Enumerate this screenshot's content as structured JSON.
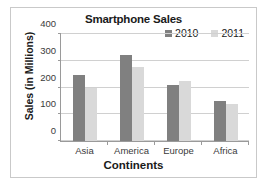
{
  "chart_data": {
    "type": "bar",
    "title": "Smartphone Sales",
    "xlabel": "Continents",
    "ylabel": "Sales (in Millions)",
    "categories": [
      "Asia",
      "America",
      "Europe",
      "Africa"
    ],
    "series": [
      {
        "name": "2010",
        "color": "#808080",
        "values": [
          248,
          320,
          210,
          148
        ]
      },
      {
        "name": "2011",
        "color": "#d9d9d9",
        "values": [
          200,
          275,
          225,
          138
        ]
      }
    ],
    "ylim": [
      0,
      400
    ],
    "yticks": [
      0,
      100,
      200,
      300,
      400
    ],
    "ytick_labels": [
      "0",
      "100",
      "200",
      "300",
      "400"
    ],
    "grid": true,
    "legend_position": "top-right"
  }
}
